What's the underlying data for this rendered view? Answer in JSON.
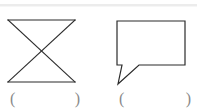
{
  "page": {
    "background_color": "#ffffff",
    "rule_color": "#ececec",
    "ink_color": "#2b2b2b",
    "paren_color": "#8a8a8a",
    "width": 197,
    "height": 112
  },
  "top_rule": {
    "name": "top-divider-rule",
    "visible": true
  },
  "figures": [
    {
      "id": "figure-1",
      "shape_name": "bowtie-hourglass-x-figure",
      "description": "Two triangles meeting at a central point forming an X / bowtie outline",
      "stroke_color": "#2b2b2b",
      "stroke_width": 1.2,
      "fill": "none",
      "points": {
        "top_left": [
          8,
          20
        ],
        "top_right": [
          75,
          20
        ],
        "bottom_left": [
          8,
          82
        ],
        "bottom_right": [
          75,
          82
        ],
        "center_crossing": [
          42,
          51
        ]
      },
      "segments": [
        "top_left->top_right",
        "bottom_left->bottom_right",
        "top_left->bottom_right",
        "top_right->bottom_left"
      ]
    },
    {
      "id": "figure-2",
      "shape_name": "speech-bubble-figure",
      "description": "Rectangular speech balloon with a pointed tail extending down and to the left",
      "stroke_color": "#2b2b2b",
      "stroke_width": 1.2,
      "fill": "none",
      "points": {
        "top_left": [
          117,
          21
        ],
        "top_right": [
          185,
          21
        ],
        "bottom_right": [
          185,
          65
        ],
        "tail_join_right": [
          139,
          65
        ],
        "tail_tip": [
          118,
          84
        ],
        "tail_join_left": [
          122,
          65
        ],
        "bottom_left": [
          117,
          65
        ]
      }
    }
  ],
  "answer_blanks": [
    {
      "id": "answer-blank-1",
      "for_figure": "figure-1",
      "open_paren": "(",
      "close_paren": ")",
      "value": ""
    },
    {
      "id": "answer-blank-2",
      "for_figure": "figure-2",
      "open_paren": "(",
      "close_paren": ")",
      "value": ""
    }
  ]
}
